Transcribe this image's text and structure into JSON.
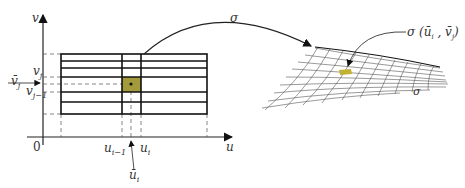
{
  "diagram": {
    "left_panel": {
      "axes": {
        "x_label": "u",
        "y_label": "v",
        "origin_label": "0"
      },
      "u_ticks": {
        "prev": "u",
        "prev_sub": "i−1",
        "curr": "u",
        "curr_sub": "i",
        "bar": "ū",
        "bar_sub": "i"
      },
      "v_ticks": {
        "curr": "v",
        "curr_sub": "j",
        "prev": "v",
        "prev_sub": "j−1",
        "bar": "v̄",
        "bar_sub": "j"
      },
      "highlight_color": "#a39a3b"
    },
    "mapping": {
      "arrow_label": "σ"
    },
    "right_panel": {
      "surface_label": "σ",
      "point_label": "σ (ū",
      "point_label_sub_i": "i",
      "point_label_mid": " , v̄",
      "point_label_sub_j": "j",
      "point_label_end": ")",
      "highlight_color": "#c2b233"
    }
  }
}
